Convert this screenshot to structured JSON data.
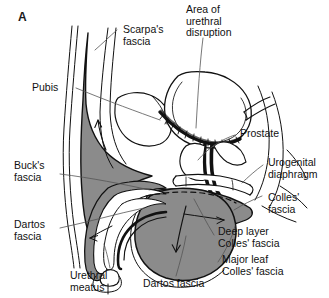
{
  "figure": {
    "panel_letter": "A",
    "type": "anatomical-diagram",
    "colors": {
      "fill_gray": "#8b8b8b",
      "outline": "#111111",
      "background": "#ffffff",
      "leader_line": "#555555",
      "text": "#111111"
    }
  },
  "labels": {
    "scarpas_fascia": "Scarpa's\nfascia",
    "area_of_urethral_disruption": "Area of\nurethral\ndisruption",
    "pubis": "Pubis",
    "prostate": "Prostate",
    "bucks_fascia": "Buck's\nfascia",
    "urogenital_diaphragm": "Urogenital\ndiaphragm",
    "colles_fascia": "Colles'\nfascia",
    "deep_layer_colles_fascia": "Deep layer\nColles' fascia",
    "dartos_fascia_left": "Dartos\nfascia",
    "major_leaf_colles_fascia": "Major leaf\nColles' fascia",
    "urethral_meatus": "Urethral\nmeatus",
    "dartos_fascia_bottom": "Dartos fascia"
  }
}
